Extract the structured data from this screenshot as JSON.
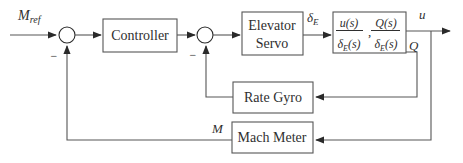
{
  "figure": {
    "colors": {
      "background": "#ffffff",
      "line": "#565656",
      "arrow": "#2a2a2a",
      "text": "#2f2f2f",
      "box_fill": "#ffffff"
    },
    "labels": {
      "m_ref": {
        "base": "M",
        "sub": "ref"
      },
      "minus": "−",
      "delta_e": {
        "base": "δ",
        "sub": "E"
      },
      "u_out": "u",
      "q_out": "Q",
      "m_feedback": "M"
    },
    "blocks": {
      "controller": {
        "label": "Controller"
      },
      "elevator_servo": {
        "line1": "Elevator",
        "line2": "Servo"
      },
      "aircraft": {
        "frac1_num": "u(s)",
        "frac2_num": "Q(s)",
        "den_base": "δ",
        "den_sub": "E",
        "den_tail": "(s)",
        "separator": ","
      },
      "rate_gyro": {
        "label": "Rate Gyro"
      },
      "mach_meter": {
        "label": "Mach Meter"
      }
    }
  }
}
